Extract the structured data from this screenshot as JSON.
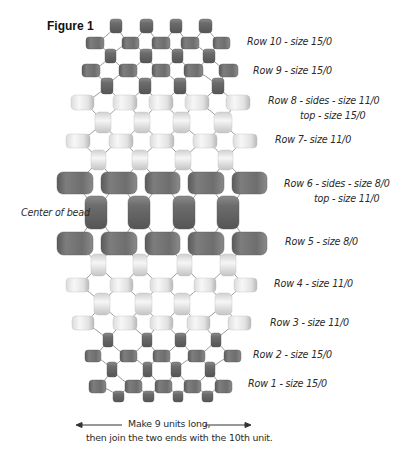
{
  "figure": {
    "title": "Figure 1"
  },
  "row_labels": [
    {
      "id": "row10",
      "text": "Row 10 - size 15/0"
    },
    {
      "id": "row9",
      "text": "Row 9 - size 15/0"
    },
    {
      "id": "row8a",
      "text": "Row 8 - sides - size 11/0"
    },
    {
      "id": "row8b",
      "text": "top - size 15/0"
    },
    {
      "id": "row7",
      "text": "Row 7- size 11/0"
    },
    {
      "id": "row6a",
      "text": "Row 6 - sides - size 8/0"
    },
    {
      "id": "row6b",
      "text": "top - size 11/0"
    },
    {
      "id": "row5",
      "text": "Row 5 - size 8/0"
    },
    {
      "id": "row4",
      "text": "Row 4 - size 11/0"
    },
    {
      "id": "row3",
      "text": "Row 3 - size 11/0"
    },
    {
      "id": "row2",
      "text": "Row 2 - size 15/0"
    },
    {
      "id": "row1",
      "text": "Row 1 - size 15/0"
    }
  ],
  "center_label": "Center of bead",
  "instructions": {
    "line1": "Make 9 units long,",
    "line2": "then join the two ends with the 10th unit."
  },
  "colors": {
    "dark_bead": "#6f6f6f",
    "light_bead": "#e4e4e4",
    "thread": "#9a9a9a"
  },
  "bead_rows": [
    {
      "name": "row10-top",
      "shade": "dark",
      "orient": "v",
      "y": 19,
      "h": 14,
      "xs": [
        [
          110,
          12
        ],
        [
          140,
          13
        ],
        [
          170,
          12
        ],
        [
          199,
          13
        ]
      ]
    },
    {
      "name": "row10",
      "shade": "dark",
      "orient": "h",
      "y": 37,
      "h": 12,
      "xs": [
        [
          86,
          18
        ],
        [
          122,
          17
        ],
        [
          152,
          18
        ],
        [
          181,
          18
        ],
        [
          213,
          17
        ]
      ]
    },
    {
      "name": "row9-top",
      "shade": "dark",
      "orient": "v",
      "y": 49,
      "h": 14,
      "xs": [
        [
          105,
          11
        ],
        [
          140,
          12
        ],
        [
          172,
          11
        ],
        [
          203,
          12
        ]
      ]
    },
    {
      "name": "row9",
      "shade": "dark",
      "orient": "h",
      "y": 64,
      "h": 13,
      "xs": [
        [
          82,
          18
        ],
        [
          119,
          18
        ],
        [
          152,
          18
        ],
        [
          184,
          19
        ],
        [
          219,
          19
        ]
      ]
    },
    {
      "name": "row8-top",
      "shade": "dark",
      "orient": "v",
      "y": 78,
      "h": 16,
      "xs": [
        [
          101,
          12
        ],
        [
          139,
          12
        ],
        [
          174,
          12
        ],
        [
          212,
          12
        ]
      ]
    },
    {
      "name": "row8-sides",
      "shade": "light",
      "orient": "h",
      "y": 95,
      "h": 15,
      "xs": [
        [
          71,
          23
        ],
        [
          113,
          24
        ],
        [
          149,
          24
        ],
        [
          185,
          24
        ],
        [
          226,
          24
        ]
      ]
    },
    {
      "name": "row7-top",
      "shade": "light",
      "orient": "v",
      "y": 112,
      "h": 21,
      "xs": [
        [
          95,
          16
        ],
        [
          134,
          16
        ],
        [
          173,
          17
        ],
        [
          214,
          18
        ]
      ]
    },
    {
      "name": "row7",
      "shade": "light",
      "orient": "h",
      "y": 134,
      "h": 14,
      "xs": [
        [
          66,
          24
        ],
        [
          109,
          24
        ],
        [
          150,
          24
        ],
        [
          193,
          24
        ],
        [
          233,
          24
        ]
      ]
    },
    {
      "name": "row6-top",
      "shade": "light",
      "orient": "v",
      "y": 150,
      "h": 20,
      "xs": [
        [
          91,
          15
        ],
        [
          132,
          16
        ],
        [
          175,
          16
        ],
        [
          218,
          15
        ]
      ]
    },
    {
      "name": "row6-sides",
      "shade": "dark",
      "orient": "h",
      "y": 172,
      "h": 22,
      "xs": [
        [
          57,
          36
        ],
        [
          101,
          36
        ],
        [
          145,
          35
        ],
        [
          188,
          36
        ],
        [
          232,
          35
        ]
      ]
    },
    {
      "name": "center",
      "shade": "dark",
      "orient": "v",
      "y": 196,
      "h": 33,
      "xs": [
        [
          85,
          22
        ],
        [
          128,
          22
        ],
        [
          173,
          22
        ],
        [
          217,
          22
        ]
      ]
    },
    {
      "name": "row5",
      "shade": "dark",
      "orient": "h",
      "y": 232,
      "h": 23,
      "xs": [
        [
          57,
          36
        ],
        [
          101,
          36
        ],
        [
          145,
          35
        ],
        [
          188,
          36
        ],
        [
          232,
          35
        ]
      ]
    },
    {
      "name": "row4-top",
      "shade": "light",
      "orient": "v",
      "y": 254,
      "h": 22,
      "xs": [
        [
          91,
          15
        ],
        [
          133,
          14
        ],
        [
          177,
          15
        ],
        [
          220,
          16
        ]
      ]
    },
    {
      "name": "row4",
      "shade": "light",
      "orient": "h",
      "y": 278,
      "h": 14,
      "xs": [
        [
          66,
          23
        ],
        [
          110,
          23
        ],
        [
          150,
          23
        ],
        [
          194,
          22
        ],
        [
          234,
          23
        ]
      ]
    },
    {
      "name": "row3-top",
      "shade": "light",
      "orient": "v",
      "y": 293,
      "h": 22,
      "xs": [
        [
          94,
          16
        ],
        [
          135,
          17
        ],
        [
          174,
          16
        ],
        [
          215,
          17
        ]
      ]
    },
    {
      "name": "row3",
      "shade": "light",
      "orient": "h",
      "y": 316,
      "h": 14,
      "xs": [
        [
          72,
          22
        ],
        [
          113,
          24
        ],
        [
          150,
          23
        ],
        [
          187,
          23
        ],
        [
          228,
          23
        ]
      ]
    },
    {
      "name": "row2-top",
      "shade": "dark",
      "orient": "v",
      "y": 333,
      "h": 14,
      "xs": [
        [
          103,
          10
        ],
        [
          142,
          10
        ],
        [
          175,
          11
        ],
        [
          211,
          10
        ]
      ]
    },
    {
      "name": "row2",
      "shade": "dark",
      "orient": "h",
      "y": 350,
      "h": 12,
      "xs": [
        [
          85,
          16
        ],
        [
          120,
          17
        ],
        [
          153,
          17
        ],
        [
          188,
          17
        ],
        [
          224,
          17
        ]
      ]
    },
    {
      "name": "row1-top",
      "shade": "dark",
      "orient": "v",
      "y": 362,
      "h": 15,
      "xs": [
        [
          107,
          10
        ],
        [
          143,
          9
        ],
        [
          171,
          10
        ],
        [
          205,
          10
        ]
      ]
    },
    {
      "name": "row1",
      "shade": "dark",
      "orient": "h",
      "y": 380,
      "h": 13,
      "xs": [
        [
          89,
          17
        ],
        [
          125,
          17
        ],
        [
          155,
          17
        ],
        [
          184,
          17
        ],
        [
          215,
          17
        ]
      ]
    },
    {
      "name": "row1-bottom",
      "shade": "dark",
      "orient": "v",
      "y": 391,
      "h": 11,
      "xs": [
        [
          113,
          11
        ],
        [
          143,
          11
        ],
        [
          173,
          10
        ],
        [
          202,
          11
        ]
      ]
    }
  ]
}
